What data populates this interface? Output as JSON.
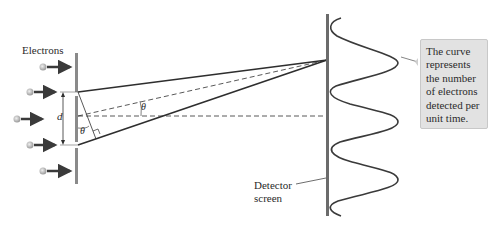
{
  "labels": {
    "electrons": "Electrons",
    "slit_separation": "d",
    "angle_left": "θ",
    "angle_right": "θ",
    "detector": "Detector",
    "screen": "screen"
  },
  "callout": {
    "lines": [
      "The curve",
      "represents",
      "the number",
      "of electrons",
      "detected per",
      "unit time."
    ]
  },
  "colors": {
    "line": "#2e2e2e",
    "barrier": "#8a8a8a",
    "callout_bg": "#e2e2e2",
    "electron": "#bdbdbd"
  }
}
